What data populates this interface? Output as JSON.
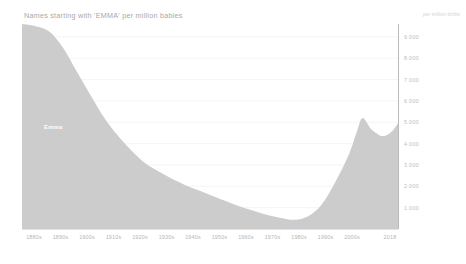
{
  "header": {
    "title": "Names starting with 'EMMA' per million babies",
    "unit_note": "per million births"
  },
  "series_label": {
    "emma": "Emma"
  },
  "colors": {
    "area_fill": "#cccccc",
    "background": "#ffffff",
    "title_text": "#a8a8a8",
    "tick_text": "#bdbdbd",
    "gridline": "#f2f2f2",
    "axis_line": "#b9b9b9"
  },
  "chart_data": {
    "type": "area",
    "title": "Names starting with 'EMMA' per million babies",
    "subtitle": "",
    "xlabel": "",
    "ylabel": "per million births",
    "grid": true,
    "legend": "in-plot label",
    "xlim": [
      "1880s",
      "2018"
    ],
    "ylim": [
      0,
      9600
    ],
    "y_ticks": [
      1000,
      2000,
      3000,
      4000,
      5000,
      6000,
      7000,
      8000,
      9000
    ],
    "y_tick_labels": [
      "1.000",
      "2.000",
      "3.000",
      "4.000",
      "5.000",
      "6.000",
      "7.000",
      "8.000",
      "9.000"
    ],
    "x_tick_labels": [
      "1880s",
      "1890s",
      "1900s",
      "1910s",
      "1920s",
      "1930s",
      "1940s",
      "1950s",
      "1960s",
      "1970s",
      "1980s",
      "1990s",
      "2000s",
      "2018"
    ],
    "series": [
      {
        "name": "Emma",
        "x": [
          1880,
          1885,
          1890,
          1895,
          1900,
          1905,
          1910,
          1915,
          1920,
          1925,
          1930,
          1935,
          1940,
          1945,
          1950,
          1955,
          1960,
          1965,
          1970,
          1975,
          1980,
          1985,
          1990,
          1995,
          2000,
          2003,
          2005,
          2008,
          2010,
          2012,
          2014,
          2016,
          2018
        ],
        "values": [
          9600,
          9500,
          9250,
          8500,
          7400,
          6300,
          5250,
          4400,
          3700,
          3100,
          2700,
          2350,
          2050,
          1800,
          1550,
          1300,
          1050,
          850,
          650,
          520,
          430,
          600,
          1150,
          2200,
          3500,
          4600,
          5200,
          4700,
          4500,
          4350,
          4400,
          4600,
          4950
        ]
      }
    ],
    "annotations": [
      {
        "text": "Emma",
        "x": 1900,
        "y": 5000
      }
    ]
  }
}
